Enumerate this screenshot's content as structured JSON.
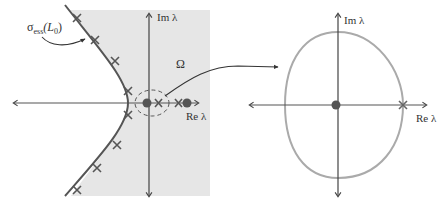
{
  "figure": {
    "left_panel": {
      "shaded_region_label": "Ω",
      "essential_spectrum_label": {
        "sigma": "σ",
        "subscript": "ess",
        "operator": "(L",
        "operator_subscript": "0",
        "close": ")"
      },
      "axes": {
        "im_label": "Im λ",
        "re_label": "Re λ"
      },
      "colors": {
        "shade": "#e6e6e6",
        "curve": "#555555",
        "axis": "#444444",
        "marker": "#555555"
      },
      "curve_x_marks": 8,
      "eigenvalues_near_origin": [
        "filled-dot",
        "x-mark"
      ],
      "eigenvalues_right": [
        "x-mark",
        "filled-dot"
      ]
    },
    "connector_arrow": "zoom of dashed region",
    "right_panel": {
      "axes": {
        "im_label": "Im λ",
        "re_label": "Re λ"
      },
      "colors": {
        "contour": "#aaaaaa",
        "axis": "#444444"
      },
      "markers": [
        "filled-dot-at-origin",
        "x-mark-on-contour"
      ]
    }
  }
}
